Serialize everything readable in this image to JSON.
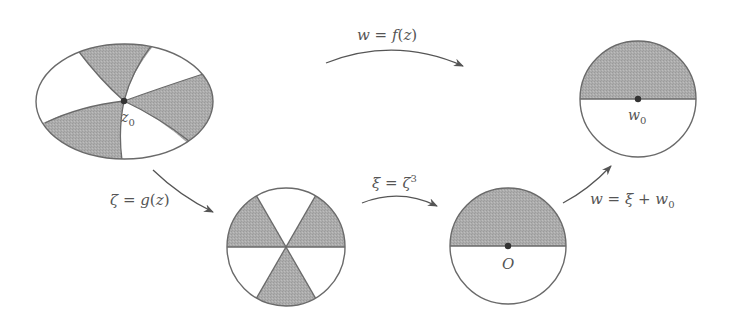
{
  "diagram": {
    "colors": {
      "shade": "#a9a9a9",
      "stroke": "#6a6a6a",
      "point": "#333333",
      "arrow": "#555555",
      "label": "#555555"
    },
    "nodes": [
      {
        "id": "z-domain",
        "shape": "ellipse",
        "description": "Domain in z-plane divided into 6 curved sectors, 3 shaded, meeting at z0",
        "center_label": "z",
        "center_label_sub": "0"
      },
      {
        "id": "zeta-disk",
        "shape": "circle",
        "description": "Unit disk in ζ-plane divided into 6 equal sectors by 3 diameters, alternating shaded"
      },
      {
        "id": "xi-disk",
        "shape": "circle",
        "description": "Disk in ξ-plane, upper half shaded, centre O",
        "center_label": "O"
      },
      {
        "id": "w-disk",
        "shape": "circle",
        "description": "Disk in w-plane, upper half shaded, centre w0",
        "center_label": "w",
        "center_label_sub": "0"
      }
    ],
    "edges": [
      {
        "from": "z-domain",
        "to": "w-disk",
        "label": "w = f(z)",
        "label_parts": [
          "w",
          " = ",
          "f",
          "(",
          "z",
          ")"
        ]
      },
      {
        "from": "z-domain",
        "to": "zeta-disk",
        "label": "ζ = g(z)",
        "label_parts": [
          "ζ",
          " = ",
          "g",
          "(",
          "z",
          ")"
        ]
      },
      {
        "from": "zeta-disk",
        "to": "xi-disk",
        "label": "ξ = ζ³",
        "label_parts": [
          "ξ",
          " = ",
          "ζ",
          "3"
        ]
      },
      {
        "from": "xi-disk",
        "to": "w-disk",
        "label": "w = ξ + w0",
        "label_parts": [
          "w",
          " = ",
          "ξ",
          " + ",
          "w",
          "0"
        ]
      }
    ]
  }
}
